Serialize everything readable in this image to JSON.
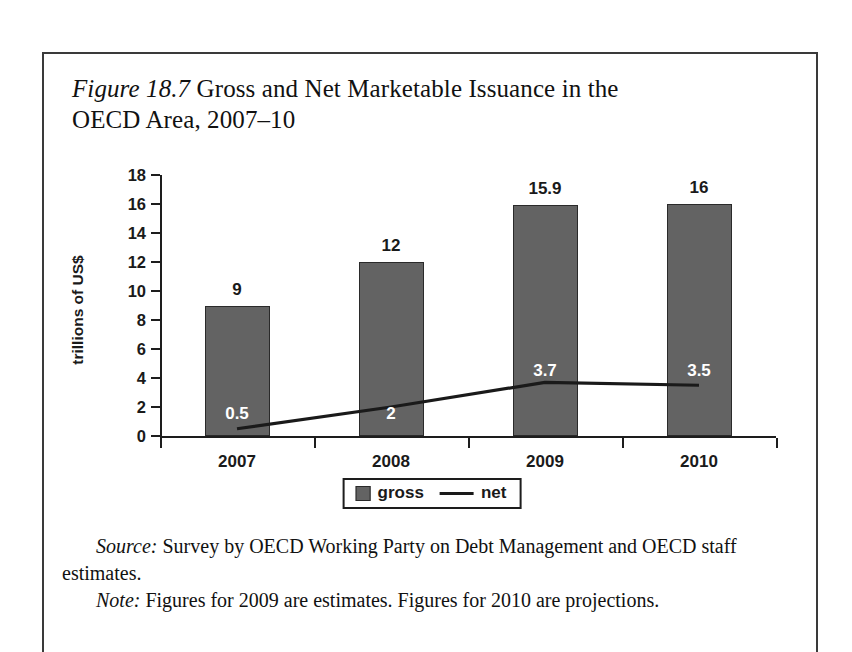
{
  "figure": {
    "number_label": "Figure 18.7",
    "title": " Gross and Net Marketable Issuance in the OECD Area, 2007–10"
  },
  "notes": {
    "source_lead": "Source:",
    "source_text": " Survey by OECD Working Party on Debt Management and OECD staff estimates.",
    "note_lead": "Note:",
    "note_text": " Figures for 2009 are estimates. Figures for 2010 are projections."
  },
  "legend": {
    "gross_label": "gross",
    "net_label": "net",
    "gross_color": "#636363",
    "net_color": "#1a1a1a"
  },
  "chart_data": {
    "type": "bar",
    "title": "Figure 18.7 Gross and Net Marketable Issuance in the OECD Area, 2007–10",
    "xlabel": "",
    "ylabel": "trillions of US$",
    "categories": [
      "2007",
      "2008",
      "2009",
      "2010"
    ],
    "ylim": [
      0,
      18
    ],
    "yticks": [
      0,
      2,
      4,
      6,
      8,
      10,
      12,
      14,
      16,
      18
    ],
    "ytick_labels": [
      "0",
      "2",
      "4",
      "6",
      "8",
      "10",
      "12",
      "14",
      "16",
      "18"
    ],
    "grid": false,
    "legend_position": "bottom-center",
    "series": [
      {
        "name": "gross",
        "type": "bar",
        "color": "#636363",
        "values": [
          9,
          12,
          15.9,
          16
        ],
        "labels": [
          "9",
          "12",
          "15.9",
          "16"
        ],
        "label_position": "above"
      },
      {
        "name": "net",
        "type": "line",
        "color": "#1a1a1a",
        "values": [
          0.5,
          2,
          3.7,
          3.5
        ],
        "labels": [
          "0.5",
          "2",
          "3.7",
          "3.5"
        ],
        "label_position": "inside-bar"
      }
    ]
  }
}
